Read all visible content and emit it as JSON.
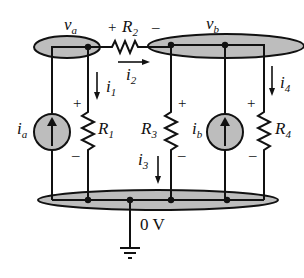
{
  "diagram": {
    "type": "circuit-schematic",
    "colors": {
      "node_fill": "#bdbdbd",
      "wire": "#111111",
      "source_fill": "#bdbdbd",
      "background": "#ffffff"
    },
    "nodes": [
      {
        "id": "a",
        "label": "v",
        "sub": "a"
      },
      {
        "id": "b",
        "label": "v",
        "sub": "b"
      },
      {
        "id": "ground",
        "label": "0 V"
      }
    ],
    "components": {
      "R1": {
        "label": "R",
        "sub": "1",
        "plus": "+",
        "minus": "–",
        "current": "i",
        "current_sub": "1"
      },
      "R2": {
        "label": "R",
        "sub": "2",
        "plus": "+",
        "minus": "–",
        "current": "i",
        "current_sub": "2"
      },
      "R3": {
        "label": "R",
        "sub": "3",
        "plus": "+",
        "minus": "–",
        "current": "i",
        "current_sub": "3"
      },
      "R4": {
        "label": "R",
        "sub": "4",
        "plus": "+",
        "minus": "–",
        "current": "i",
        "current_sub": "4"
      },
      "ia": {
        "label": "i",
        "sub": "a",
        "type": "current-source",
        "direction": "up"
      },
      "ib": {
        "label": "i",
        "sub": "b",
        "type": "current-source",
        "direction": "up"
      }
    },
    "ground_symbol": "ground-icon"
  }
}
